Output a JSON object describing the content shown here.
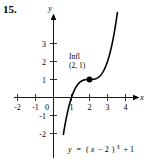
{
  "problem": {
    "number": "15."
  },
  "chart_data": {
    "type": "line",
    "title": "",
    "subtitle": "",
    "xlabel": "x",
    "ylabel": "y",
    "equation_label": "y = (x − 2)³ + 1",
    "equation_parts": {
      "lhs": "y",
      "equals": "=",
      "open_paren": "(",
      "var": "x",
      "minus": "− 2",
      "close_paren": ")",
      "exponent": "3",
      "plus_one": "+ 1"
    },
    "function": "y = (x - 2)^3 + 1",
    "xlim": [
      -2.6,
      4.6
    ],
    "ylim": [
      -2.9,
      4.1
    ],
    "grid": false,
    "legend": "none",
    "x_ticks": [
      "-2",
      "-1",
      "0",
      "1",
      "2",
      "3",
      "4"
    ],
    "x_tick_values": [
      -2,
      -1,
      0,
      1,
      2,
      3,
      4
    ],
    "y_ticks": [
      "3",
      "2",
      "1",
      "-1",
      "-2"
    ],
    "y_tick_values": [
      3,
      2,
      1,
      -1,
      -2
    ],
    "origin_label": "0",
    "curve_domain": [
      0.55,
      3.55
    ],
    "x_intercept": 1,
    "y_intercept": -7,
    "annotations": [
      {
        "name": "inflection",
        "line1": "Infl",
        "line2": "(2, 1)",
        "point_x": 2,
        "point_y": 1,
        "marker": "filled-circle"
      }
    ],
    "colors": {
      "curve": "#000000",
      "axis": "#000000",
      "text": "#000000",
      "background": "#ffffff",
      "marker": "#000000"
    }
  }
}
